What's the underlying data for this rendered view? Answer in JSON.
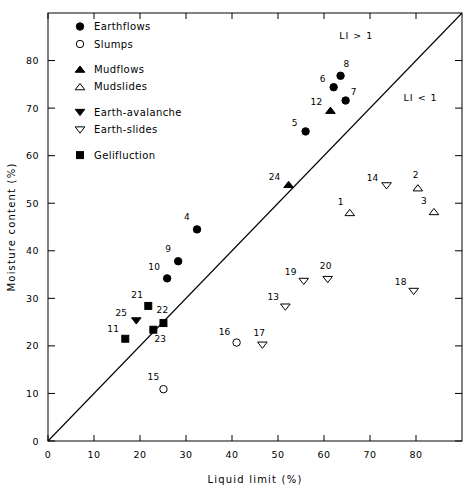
{
  "chart_data": {
    "type": "scatter",
    "title": "",
    "xlabel": "Liquid  limit  (%)",
    "ylabel": "Moisture  content  (%)",
    "xlim": [
      0,
      90
    ],
    "ylim": [
      0,
      90
    ],
    "xticks": [
      0,
      10,
      20,
      30,
      40,
      50,
      60,
      70,
      80
    ],
    "yticks": [
      0,
      10,
      20,
      30,
      40,
      50,
      60,
      70,
      80
    ],
    "xtick_labels": [
      "0",
      "10",
      "20",
      "30",
      "40",
      "50",
      "60",
      "70",
      "80"
    ],
    "ytick_labels": [
      "0",
      "10",
      "20",
      "30",
      "40",
      "50",
      "60",
      "70",
      "80"
    ],
    "grid": false,
    "legend_position": "top-left",
    "reference_line": {
      "name": "liquidity-index-unity-line",
      "from": [
        0,
        0
      ],
      "to": [
        90,
        90
      ],
      "annotations": [
        {
          "text": "LI > 1",
          "x": 67,
          "y": 84.5
        },
        {
          "text": "LI < 1",
          "x": 81,
          "y": 71.5
        }
      ]
    },
    "series": [
      {
        "name": "Earthflows",
        "marker": "filled-circle",
        "points": [
          {
            "label": "4",
            "x": 32.4,
            "y": 44.5,
            "lx": -10,
            "ly": -9
          },
          {
            "label": "5",
            "x": 56.0,
            "y": 65.1,
            "lx": -11,
            "ly": -5
          },
          {
            "label": "6",
            "x": 62.1,
            "y": 74.4,
            "lx": -11,
            "ly": -5
          },
          {
            "label": "7",
            "x": 64.7,
            "y": 71.6,
            "lx": 8,
            "ly": -6
          },
          {
            "label": "8",
            "x": 63.6,
            "y": 76.8,
            "lx": 6,
            "ly": -9
          },
          {
            "label": "9",
            "x": 28.3,
            "y": 37.8,
            "lx": -10,
            "ly": -9
          },
          {
            "label": "10",
            "x": 25.9,
            "y": 34.2,
            "lx": -13,
            "ly": -8
          }
        ]
      },
      {
        "name": "Slumps",
        "marker": "open-circle",
        "points": [
          {
            "label": "15",
            "x": 25.1,
            "y": 10.9,
            "lx": -10,
            "ly": -9
          },
          {
            "label": "16",
            "x": 41.0,
            "y": 20.7,
            "lx": -12,
            "ly": -8
          }
        ]
      },
      {
        "name": "Mudflows",
        "marker": "filled-triangle-up",
        "points": [
          {
            "label": "12",
            "x": 61.4,
            "y": 69.5,
            "lx": -14,
            "ly": -5
          },
          {
            "label": "24",
            "x": 52.3,
            "y": 53.9,
            "lx": -14,
            "ly": -5
          }
        ]
      },
      {
        "name": "Mudslides",
        "marker": "open-triangle-up",
        "points": [
          {
            "label": "1",
            "x": 65.6,
            "y": 48.0,
            "lx": -9,
            "ly": -8
          },
          {
            "label": "2",
            "x": 80.4,
            "y": 53.2,
            "lx": -2,
            "ly": -10
          },
          {
            "label": "3",
            "x": 83.9,
            "y": 48.2,
            "lx": -10,
            "ly": -8
          }
        ]
      },
      {
        "name": "Earth-avalanche",
        "marker": "filled-triangle-down",
        "points": [
          {
            "label": "25",
            "x": 19.2,
            "y": 25.3,
            "lx": -15,
            "ly": -5
          }
        ]
      },
      {
        "name": "Earth-slides",
        "marker": "open-triangle-down",
        "points": [
          {
            "label": "13",
            "x": 51.6,
            "y": 28.2,
            "lx": -12,
            "ly": -7
          },
          {
            "label": "14",
            "x": 73.6,
            "y": 53.7,
            "lx": -14,
            "ly": -5
          },
          {
            "label": "17",
            "x": 46.6,
            "y": 20.2,
            "lx": -3,
            "ly": -9
          },
          {
            "label": "18",
            "x": 79.5,
            "y": 31.5,
            "lx": -13,
            "ly": -6
          },
          {
            "label": "19",
            "x": 55.6,
            "y": 33.6,
            "lx": -13,
            "ly": -6
          },
          {
            "label": "20",
            "x": 60.8,
            "y": 34.0,
            "lx": -2,
            "ly": -10
          }
        ]
      },
      {
        "name": "Gelifluction",
        "marker": "filled-square",
        "points": [
          {
            "label": "11",
            "x": 16.8,
            "y": 21.5,
            "lx": -12,
            "ly": -7
          },
          {
            "label": "21",
            "x": 21.8,
            "y": 28.4,
            "lx": -11,
            "ly": -8
          },
          {
            "label": "22",
            "x": 25.1,
            "y": 24.8,
            "lx": -1,
            "ly": -10
          },
          {
            "label": "23",
            "x": 22.9,
            "y": 23.4,
            "lx": 7,
            "ly": 12
          }
        ]
      }
    ]
  },
  "legend": {
    "items": [
      {
        "label": "Earthflows",
        "marker": "filled-circle"
      },
      {
        "label": "Slumps",
        "marker": "open-circle"
      },
      {
        "label": "Mudflows",
        "marker": "filled-triangle-up"
      },
      {
        "label": "Mudslides",
        "marker": "open-triangle-up"
      },
      {
        "label": "Earth-avalanche",
        "marker": "filled-triangle-down"
      },
      {
        "label": "Earth-slides",
        "marker": "open-triangle-down"
      },
      {
        "label": "Gelifluction",
        "marker": "filled-square"
      }
    ]
  },
  "colors": {
    "ink": "#000000",
    "axis": "#1a1a1a",
    "background": "#ffffff"
  }
}
